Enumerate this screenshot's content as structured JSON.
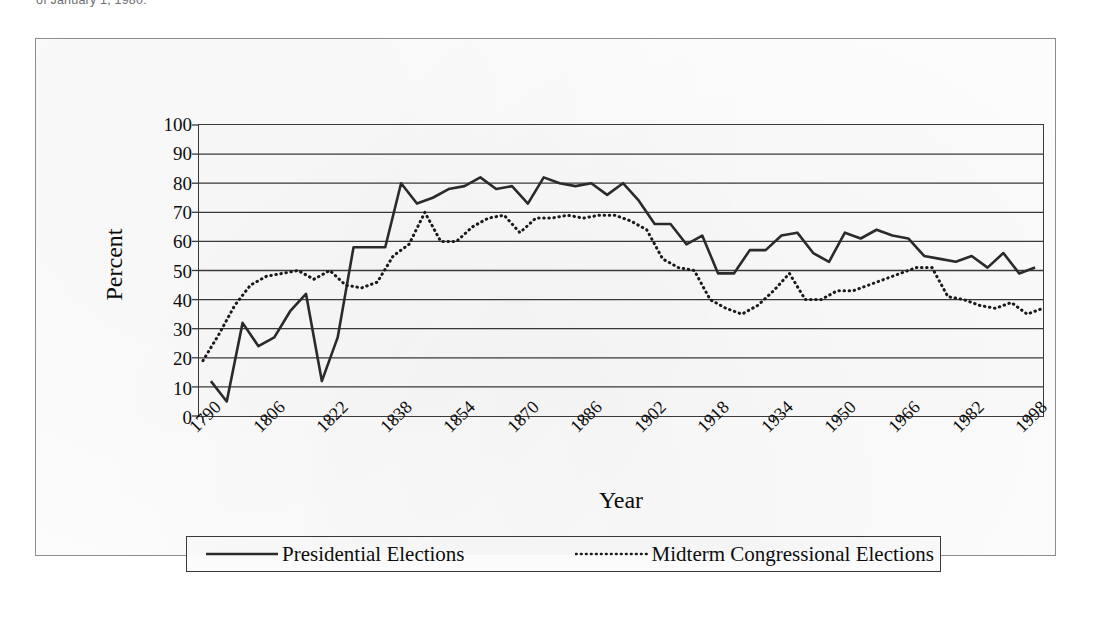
{
  "caption_top": "of January 1, 1980.",
  "chart_data": {
    "type": "line",
    "title": "",
    "xlabel": "Year",
    "ylabel": "Percent",
    "ylim": [
      0,
      100
    ],
    "ytick_step": 10,
    "yticks": [
      0,
      10,
      20,
      30,
      40,
      50,
      60,
      70,
      80,
      90,
      100
    ],
    "xlim": [
      1789,
      2002
    ],
    "xticks": [
      1790,
      1806,
      1822,
      1838,
      1854,
      1870,
      1886,
      1902,
      1918,
      1934,
      1950,
      1966,
      1982,
      1998
    ],
    "xtick_labels": [
      "1790",
      "1806",
      "1822",
      "1838",
      "1854",
      "1870",
      "1886",
      "1902",
      "1918",
      "1934",
      "1950",
      "1966",
      "1982",
      "1998"
    ],
    "grid": "horizontal",
    "legend_position": "bottom",
    "series": [
      {
        "name": "Presidential Elections",
        "style": "solid",
        "color": "#2b2b2b",
        "x": [
          1792,
          1796,
          1800,
          1804,
          1808,
          1812,
          1816,
          1820,
          1824,
          1828,
          1832,
          1836,
          1840,
          1844,
          1848,
          1852,
          1856,
          1860,
          1864,
          1868,
          1872,
          1876,
          1880,
          1884,
          1888,
          1892,
          1896,
          1900,
          1904,
          1908,
          1912,
          1916,
          1920,
          1924,
          1928,
          1932,
          1936,
          1940,
          1944,
          1948,
          1952,
          1956,
          1960,
          1964,
          1968,
          1972,
          1976,
          1980,
          1984,
          1988,
          1992,
          1996,
          2000
        ],
        "values": [
          12,
          5,
          32,
          24,
          27,
          36,
          42,
          12,
          27,
          58,
          58,
          58,
          80,
          73,
          75,
          78,
          79,
          82,
          78,
          79,
          73,
          82,
          80,
          79,
          80,
          76,
          80,
          74,
          66,
          66,
          59,
          62,
          49,
          49,
          57,
          57,
          62,
          63,
          56,
          53,
          63,
          61,
          64,
          62,
          61,
          55,
          54,
          53,
          55,
          51,
          56,
          49,
          51
        ],
        "note": "Turnout in presidential election years"
      },
      {
        "name": "Midterm Congressional Elections",
        "style": "dotted",
        "color": "#1a1a1a",
        "x": [
          1790,
          1794,
          1798,
          1802,
          1806,
          1810,
          1814,
          1818,
          1822,
          1826,
          1830,
          1834,
          1838,
          1842,
          1846,
          1850,
          1854,
          1858,
          1862,
          1866,
          1870,
          1874,
          1878,
          1882,
          1886,
          1890,
          1894,
          1898,
          1902,
          1906,
          1910,
          1914,
          1918,
          1922,
          1926,
          1930,
          1934,
          1938,
          1942,
          1946,
          1950,
          1954,
          1958,
          1962,
          1966,
          1970,
          1974,
          1978,
          1982,
          1986,
          1990,
          1994,
          1998,
          2002
        ],
        "values": [
          19,
          28,
          38,
          45,
          48,
          49,
          50,
          47,
          50,
          45,
          44,
          46,
          55,
          59,
          70,
          60,
          60,
          65,
          68,
          69,
          63,
          68,
          68,
          69,
          68,
          69,
          69,
          67,
          64,
          54,
          51,
          50,
          40,
          37,
          35,
          38,
          43,
          49,
          40,
          40,
          43,
          43,
          45,
          47,
          49,
          51,
          51,
          41,
          40,
          38,
          37,
          39,
          35,
          37
        ],
        "note": "Turnout in midterm congressional election years"
      }
    ]
  },
  "legend": {
    "items": [
      {
        "label": "Presidential Elections",
        "style": "solid"
      },
      {
        "label": "Midterm Congressional Elections",
        "style": "dotted"
      }
    ]
  }
}
